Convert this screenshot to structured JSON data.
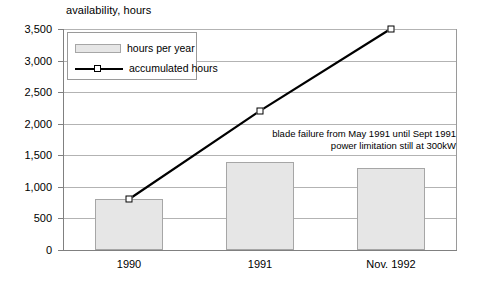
{
  "chart_data": {
    "type": "bar",
    "title": "availability, hours",
    "xlabel": "",
    "ylabel": "availability, hours",
    "categories": [
      "1990",
      "1991",
      "Nov. 1992"
    ],
    "ylim": [
      0,
      3500
    ],
    "yticks": [
      "0",
      "500",
      "1,000",
      "1,500",
      "2,000",
      "2,500",
      "3,000",
      "3,500"
    ],
    "ytick_values": [
      0,
      500,
      1000,
      1500,
      2000,
      2500,
      3000,
      3500
    ],
    "grid": true,
    "legend_position": "top-left inside",
    "series": [
      {
        "name": "hours per year",
        "type": "bar",
        "values": [
          800,
          1400,
          1300
        ],
        "color": "#e6e6e6"
      },
      {
        "name": "accumulated hours",
        "type": "line",
        "values": [
          800,
          2200,
          3500
        ],
        "color": "#000000",
        "marker": "open-square"
      }
    ],
    "annotations": [
      "blade failure from May 1991 until Sept 1991",
      "power limitation still at 300kW"
    ]
  },
  "legend": {
    "items": [
      {
        "label": "hours per year",
        "marker": "filled-rect"
      },
      {
        "label": "accumulated hours",
        "marker": "line-with-square"
      }
    ]
  },
  "colors": {
    "bar_fill": "#e6e6e6",
    "bar_stroke": "#a6a6a6",
    "grid": "#b3b3b3",
    "axis": "#808080",
    "line": "#000000"
  }
}
